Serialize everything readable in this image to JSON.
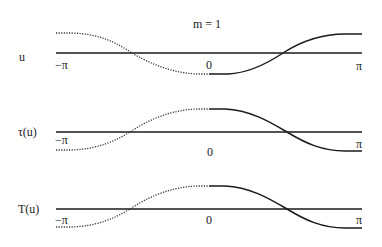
{
  "title": "m = 1",
  "panels": [
    {
      "label": "u",
      "ticks": {
        "left": "−π",
        "center": "0",
        "right": "π"
      },
      "shape": "odd-increasing: high at -π, minimum at 0, rising to π",
      "dotted_segment": "-π to 0",
      "solid_segment": "0 to π"
    },
    {
      "label": "τ(u)",
      "ticks": {
        "left": "−π",
        "center": "0",
        "right": "π"
      },
      "shape": "low at -π, maximum at 0, falling to π",
      "dotted_segment": "-π to 0",
      "solid_segment": "0 to π"
    },
    {
      "label": "T(u)",
      "ticks": {
        "left": "−π",
        "center": "0",
        "right": "π"
      },
      "shape": "low at -π, maximum at 0, falling to π",
      "dotted_segment": "-π to 0",
      "solid_segment": "0 to π"
    }
  ]
}
